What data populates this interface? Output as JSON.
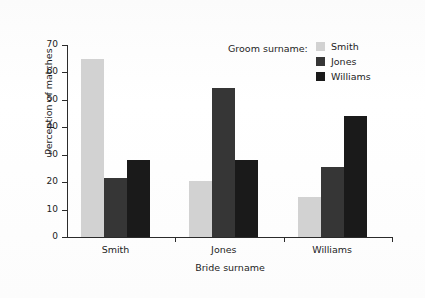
{
  "chart_data": {
    "type": "bar",
    "title": "",
    "xlabel": "Bride surname",
    "ylabel": "Perception of matches",
    "categories": [
      "Smith",
      "Jones",
      "Williams"
    ],
    "series": [
      {
        "name": "Smith",
        "color": "#d2d2d2",
        "values": [
          65,
          20.5,
          14.5
        ]
      },
      {
        "name": "Jones",
        "color": "#363636",
        "values": [
          21.5,
          54.5,
          25.5
        ]
      },
      {
        "name": "Williams",
        "color": "#1a1a1a",
        "values": [
          28,
          28,
          44
        ]
      }
    ],
    "ylim": [
      0,
      70
    ],
    "yticks": [
      0,
      10,
      20,
      30,
      40,
      50,
      60,
      70
    ],
    "ytick_labels": [
      "0",
      "10",
      "20",
      "30",
      "40",
      "50",
      "60",
      "70"
    ],
    "grid": false,
    "legend_title": "Groom surname:",
    "legend_position": "top-right"
  }
}
